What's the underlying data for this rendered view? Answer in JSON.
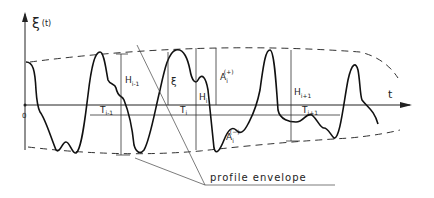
{
  "diagram": {
    "y_axis_label": "ξ",
    "y_axis_arg": "(t)",
    "x_axis_label": "t",
    "origin_label": "0",
    "annotation": "profile envelope",
    "labels": {
      "H_prev": "H",
      "H_prev_sub": "i-1",
      "H_cur": "H",
      "H_cur_sub": "i",
      "H_next": "H",
      "H_next_sub": "i+1",
      "T_prev": "T",
      "T_prev_sub": "i-1",
      "T_cur": "T",
      "T_cur_sub": "i",
      "T_next": "T",
      "T_next_sub": "i+1",
      "xi": "ξ",
      "A_plus": "A",
      "A_plus_sub": "i",
      "A_plus_sup": "(+)",
      "A_minus": "A",
      "A_minus_sub": "i",
      "A_minus_sup": "(−)"
    }
  }
}
